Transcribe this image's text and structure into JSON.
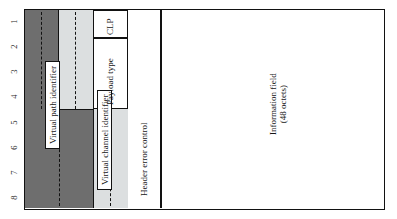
{
  "figure": {
    "bit_numbers": [
      "1",
      "2",
      "3",
      "4",
      "5",
      "6",
      "7",
      "8"
    ],
    "fields": {
      "virtual_path_identifier": "Virtual path identifier",
      "virtual_channel_identifier": "Virtual channel identifier",
      "payload_type": "Payload type",
      "clp": "CLP",
      "header_error_control": "Header error control",
      "information_field": "Information field",
      "information_field_size": "(48 octets)"
    },
    "colors": {
      "virtual_path_identifier_fill": "#6e6e6e",
      "virtual_channel_identifier_fill": "#dcdfe0",
      "plain_fill": "#ffffff",
      "stroke": "#121212",
      "page_background": "#ffffff"
    }
  }
}
